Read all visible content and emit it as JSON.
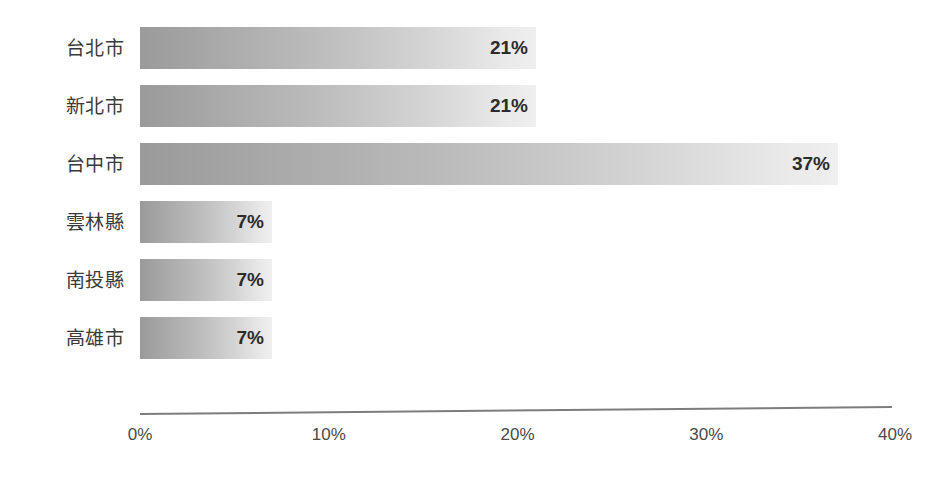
{
  "chart_data": {
    "type": "bar",
    "orientation": "horizontal",
    "title": "",
    "subtitle": "",
    "xlabel": "",
    "ylabel": "",
    "categories": [
      "台北市",
      "新北市",
      "台中市",
      "雲林縣",
      "南投縣",
      "高雄市"
    ],
    "values": [
      21,
      21,
      37,
      7,
      7,
      7
    ],
    "value_labels": [
      "21%",
      "21%",
      "37%",
      "7%",
      "7%",
      "7%"
    ],
    "xlim": [
      0,
      40
    ],
    "xticks": [
      0,
      10,
      20,
      30,
      40
    ],
    "xtick_labels": [
      "0%",
      "10%",
      "20%",
      "30%",
      "40%"
    ],
    "grid": false,
    "legend": null,
    "legend_position": "none",
    "annotations": []
  },
  "style": {
    "background": "#ffffff",
    "bar_gradient_start": "#9a9a9a",
    "bar_gradient_end": "#efefef",
    "axis_line_color": "#7d7d7d",
    "category_label_color": "#3a3a3a",
    "value_label_color": "#2b2b2b",
    "tick_label_color": "#4a4a4a"
  },
  "bars": [
    {
      "category": "台北市",
      "value": 21,
      "label": "21%"
    },
    {
      "category": "新北市",
      "value": 21,
      "label": "21%"
    },
    {
      "category": "台中市",
      "value": 37,
      "label": "37%"
    },
    {
      "category": "雲林縣",
      "value": 7,
      "label": "7%"
    },
    {
      "category": "南投縣",
      "value": 7,
      "label": "7%"
    },
    {
      "category": "高雄市",
      "value": 7,
      "label": "7%"
    }
  ],
  "axis": {
    "ticks": [
      {
        "value": 0,
        "label": "0%"
      },
      {
        "value": 10,
        "label": "10%"
      },
      {
        "value": 20,
        "label": "20%"
      },
      {
        "value": 30,
        "label": "30%"
      },
      {
        "value": 40,
        "label": "40%"
      }
    ]
  }
}
